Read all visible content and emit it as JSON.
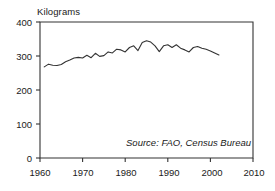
{
  "chart_data": {
    "type": "line",
    "title": "",
    "subtitle": "",
    "ylabel": "Kilograms",
    "xlabel": "",
    "ylim": [
      0,
      400
    ],
    "xlim": [
      1960,
      2010
    ],
    "grid": false,
    "legend": null,
    "yticks": [
      0,
      100,
      200,
      300,
      400
    ],
    "ytick_labels": [
      "0",
      "100",
      "200",
      "300",
      "400"
    ],
    "xticks": [
      1960,
      1970,
      1980,
      1990,
      2000,
      2010
    ],
    "xtick_labels": [
      "1960",
      "1970",
      "1980",
      "1990",
      "2000",
      "2010"
    ],
    "annotations": [
      {
        "text": "Source: FAO, Census Bureau",
        "style": "italic",
        "position": "bottom-right-inside"
      }
    ],
    "line_color": "#333333",
    "series": [
      {
        "name": "Grain use per person",
        "x": [
          1961,
          1962,
          1963,
          1964,
          1965,
          1966,
          1967,
          1968,
          1969,
          1970,
          1971,
          1972,
          1973,
          1974,
          1975,
          1976,
          1977,
          1978,
          1979,
          1980,
          1981,
          1982,
          1983,
          1984,
          1985,
          1986,
          1987,
          1988,
          1989,
          1990,
          1991,
          1992,
          1993,
          1994,
          1995,
          1996,
          1997,
          1998,
          1999,
          2000,
          2001,
          2002
        ],
        "values": [
          268,
          276,
          273,
          272,
          275,
          283,
          288,
          294,
          296,
          294,
          302,
          295,
          308,
          299,
          301,
          312,
          309,
          320,
          318,
          312,
          325,
          330,
          316,
          340,
          345,
          341,
          330,
          313,
          330,
          333,
          325,
          333,
          323,
          318,
          312,
          325,
          328,
          323,
          320,
          315,
          309,
          303
        ]
      }
    ]
  },
  "axes": {
    "frame_color": "#333333"
  }
}
